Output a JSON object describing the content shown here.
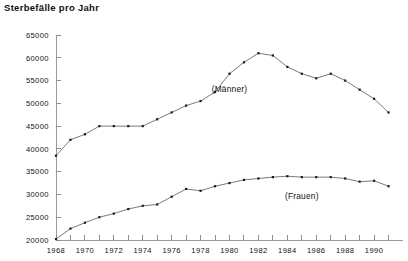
{
  "chart_data": {
    "type": "line",
    "title": "Sterbefälle pro Jahr",
    "xlabel": "",
    "ylabel": "",
    "grid": false,
    "legend_position": "inline-annotations",
    "xlim": [
      1968,
      1991
    ],
    "ylim": [
      20000,
      65000
    ],
    "ytick_labels": [
      "20000",
      "25000",
      "30000",
      "35000",
      "40000",
      "45000",
      "50000",
      "55000",
      "60000",
      "65000"
    ],
    "ytick_values": [
      20000,
      25000,
      30000,
      35000,
      40000,
      45000,
      50000,
      55000,
      60000,
      65000
    ],
    "xtick_labels": [
      "1968",
      "1970",
      "1972",
      "1974",
      "1976",
      "1978",
      "1980",
      "1982",
      "1984",
      "1986",
      "1988",
      "1990"
    ],
    "xtick_values": [
      1968,
      1970,
      1972,
      1974,
      1976,
      1978,
      1980,
      1982,
      1984,
      1986,
      1988,
      1990
    ],
    "x": [
      1968,
      1969,
      1970,
      1971,
      1972,
      1973,
      1974,
      1975,
      1976,
      1977,
      1978,
      1979,
      1980,
      1981,
      1982,
      1983,
      1984,
      1985,
      1986,
      1987,
      1988,
      1989,
      1990,
      1991
    ],
    "series": [
      {
        "name": "(Männer)",
        "color": "#6b6b6b",
        "annotation_x": 1980,
        "annotation_y": 52500,
        "values": [
          38500,
          42000,
          43200,
          45000,
          45000,
          45000,
          45000,
          46500,
          48000,
          49500,
          50500,
          52500,
          56500,
          59000,
          61000,
          60500,
          58000,
          56500,
          55500,
          56500,
          55000,
          53000,
          51000,
          48000
        ]
      },
      {
        "name": "(Frauen)",
        "color": "#6b6b6b",
        "annotation_x": 1985,
        "annotation_y": 29000,
        "values": [
          20200,
          22500,
          23800,
          25000,
          25800,
          26800,
          27500,
          27800,
          29500,
          31200,
          30800,
          31800,
          32500,
          33200,
          33500,
          33800,
          34000,
          33800,
          33800,
          33800,
          33500,
          32800,
          33000,
          31800
        ]
      }
    ]
  },
  "plot_geometry": {
    "x_axis_y": 240,
    "y_axis_x": 56,
    "plot_right": 403,
    "plot_top": 35,
    "px_per_year": 15.1,
    "px_per_1000": 4.555
  }
}
